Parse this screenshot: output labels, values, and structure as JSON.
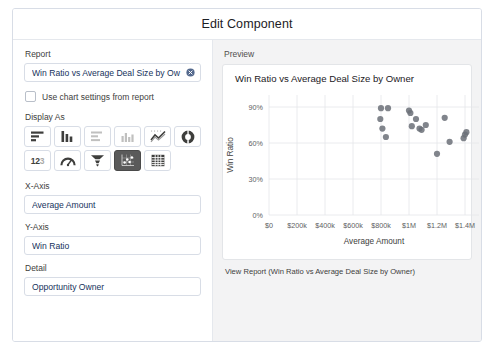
{
  "modal": {
    "title": "Edit Component"
  },
  "left_panel": {
    "report": {
      "label": "Report",
      "value": "Win Ratio vs Average Deal Size by Ow",
      "clear_icon": "clear-circle-icon"
    },
    "use_chart_settings": {
      "label": "Use chart settings from report",
      "checked": false
    },
    "display_as": {
      "label": "Display As",
      "options": [
        {
          "name": "horizontal-bar-chart",
          "selected": false,
          "dim": false
        },
        {
          "name": "vertical-bar-chart",
          "selected": false,
          "dim": false
        },
        {
          "name": "stacked-horizontal-bar-chart",
          "selected": false,
          "dim": true
        },
        {
          "name": "stacked-column-chart",
          "selected": false,
          "dim": true
        },
        {
          "name": "line-chart",
          "selected": false,
          "dim": false
        },
        {
          "name": "donut-chart",
          "selected": false,
          "dim": false
        },
        {
          "name": "metric-number",
          "selected": false,
          "dim": false
        },
        {
          "name": "gauge-chart",
          "selected": false,
          "dim": false
        },
        {
          "name": "funnel-chart",
          "selected": false,
          "dim": false
        },
        {
          "name": "scatter-chart",
          "selected": true,
          "dim": false
        },
        {
          "name": "table-chart",
          "selected": false,
          "dim": false
        }
      ]
    },
    "x_axis": {
      "label": "X-Axis",
      "value": "Average Amount"
    },
    "y_axis": {
      "label": "Y-Axis",
      "value": "Win Ratio"
    },
    "detail": {
      "label": "Detail",
      "value": "Opportunity Owner"
    }
  },
  "preview": {
    "label": "Preview",
    "view_report_link": "View Report (Win Ratio vs Average Deal Size by Owner)"
  },
  "chart_data": {
    "type": "scatter",
    "title": "Win Ratio vs Average Deal Size by Owner",
    "xlabel": "Average Amount",
    "ylabel": "Win Ratio",
    "xlim": [
      0,
      1500000
    ],
    "ylim": [
      0,
      100
    ],
    "grid": true,
    "legend": null,
    "xticks": [
      0,
      200000,
      400000,
      600000,
      800000,
      1000000,
      1200000,
      1400000
    ],
    "xticklabels": [
      "$0",
      "$200k",
      "$400k",
      "$600k",
      "$800k",
      "$1M",
      "$1.2M",
      "$1.4M"
    ],
    "yticks": [
      0,
      30,
      60,
      90
    ],
    "yticklabels": [
      "0%",
      "30%",
      "60%",
      "90%"
    ],
    "marker_color": "#6b7078",
    "points": [
      {
        "x": 800000,
        "y": 89
      },
      {
        "x": 850000,
        "y": 89
      },
      {
        "x": 795000,
        "y": 80
      },
      {
        "x": 810000,
        "y": 72
      },
      {
        "x": 835000,
        "y": 65
      },
      {
        "x": 1000000,
        "y": 87
      },
      {
        "x": 1010000,
        "y": 85
      },
      {
        "x": 1050000,
        "y": 80
      },
      {
        "x": 1020000,
        "y": 74
      },
      {
        "x": 1075000,
        "y": 72
      },
      {
        "x": 1090000,
        "y": 71
      },
      {
        "x": 1120000,
        "y": 75
      },
      {
        "x": 1200000,
        "y": 51
      },
      {
        "x": 1255000,
        "y": 81
      },
      {
        "x": 1290000,
        "y": 61
      },
      {
        "x": 1390000,
        "y": 64
      },
      {
        "x": 1400000,
        "y": 67
      },
      {
        "x": 1410000,
        "y": 69
      }
    ]
  }
}
